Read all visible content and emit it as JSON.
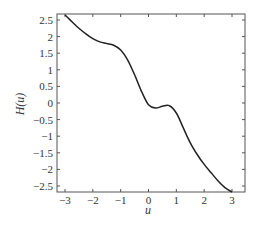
{
  "chart_data": {
    "type": "line",
    "title": "",
    "xlabel": "u",
    "ylabel": "H(u)",
    "xlim": [
      -3.3,
      3.4
    ],
    "ylim": [
      -2.65,
      2.65
    ],
    "grid": false,
    "legend": null,
    "xticks": [
      "-3",
      "-2",
      "-1",
      "0",
      "1",
      "2",
      "3"
    ],
    "yticks": [
      "2.5",
      "2",
      "1.5",
      "1",
      "0.5",
      "0",
      "-0.5",
      "-1",
      "-1.5",
      "-2",
      "-2.5"
    ],
    "series": [
      {
        "name": "H(u)",
        "x": [
          -3.0,
          -2.75,
          -2.5,
          -2.25,
          -2.0,
          -1.75,
          -1.5,
          -1.25,
          -1.0,
          -0.75,
          -0.5,
          -0.25,
          0.0,
          0.25,
          0.5,
          0.75,
          1.0,
          1.25,
          1.5,
          1.75,
          2.0,
          2.25,
          2.5,
          2.75,
          3.0
        ],
        "y": [
          2.65,
          2.45,
          2.25,
          2.08,
          1.94,
          1.84,
          1.79,
          1.74,
          1.6,
          1.3,
          0.85,
          0.35,
          -0.05,
          -0.15,
          -0.1,
          -0.08,
          -0.3,
          -0.75,
          -1.2,
          -1.55,
          -1.85,
          -2.1,
          -2.35,
          -2.55,
          -2.68
        ]
      }
    ]
  },
  "axes": {
    "xlabel": "u",
    "ylabel": "H(u)",
    "xtick_labels": [
      "-3",
      "-2",
      "-1",
      "0",
      "1",
      "2",
      "3"
    ],
    "ytick_labels": [
      "2.5",
      "2",
      "1.5",
      "1",
      "0.5",
      "0",
      "-0.5",
      "-1",
      "-1.5",
      "-2",
      "-2.5"
    ]
  }
}
